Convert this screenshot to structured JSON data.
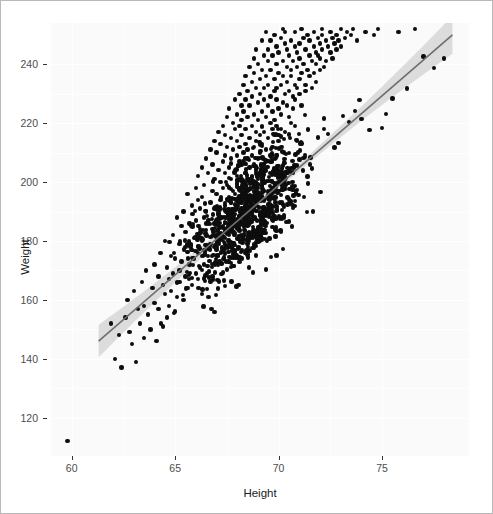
{
  "chart_data": {
    "type": "scatter",
    "title": "",
    "subtitle": "",
    "xlabel": "Height",
    "ylabel": "Weight",
    "xlim": [
      59.0,
      79.2
    ],
    "ylim": [
      107,
      254
    ],
    "xticks": [
      60,
      65,
      70,
      75
    ],
    "yticks": [
      120,
      140,
      160,
      180,
      200,
      220,
      240
    ],
    "xtick_labels": [
      "60",
      "65",
      "70",
      "75"
    ],
    "ytick_labels": [
      "120",
      "140",
      "160",
      "180",
      "200",
      "220",
      "240"
    ],
    "grid": true,
    "legend": null,
    "point_color": "#0d0d0d",
    "point_size": 4.4,
    "panel_background": "#fafafa",
    "grid_color": "#ffffff",
    "annotations": [],
    "trend": {
      "type": "linear-regression",
      "line_color": "#6e6e6e",
      "band_color": "#d5d5d5",
      "x_start": 61.3,
      "x_end": 78.4,
      "y_start": 146.0,
      "y_end": 250.0,
      "slope": 6.08,
      "intercept": -226.7,
      "band_halfwidth_start": 5.5,
      "band_halfwidth_mid": 1.2,
      "band_halfwidth_end": 6.5
    },
    "n_points": 1000,
    "x": [
      59.8,
      61.9,
      62.1,
      62.3,
      62.4,
      62.6,
      62.7,
      62.8,
      62.9,
      63.0,
      63.1,
      63.2,
      63.3,
      63.4,
      63.5,
      63.5,
      63.6,
      63.7,
      63.8,
      63.9,
      64.0,
      64.0,
      64.1,
      64.2,
      64.2,
      64.3,
      64.4,
      64.4,
      64.5,
      64.5,
      64.6,
      64.6,
      64.7,
      64.7,
      64.8,
      64.8,
      64.9,
      64.9,
      65.0,
      65.0,
      65.1,
      65.1,
      65.2,
      65.2,
      65.2,
      65.3,
      65.3,
      65.4,
      65.4,
      65.5,
      65.5,
      65.5,
      65.6,
      65.6,
      65.7,
      65.7,
      65.8,
      65.8,
      65.8,
      65.9,
      65.9,
      66.0,
      66.0,
      66.0,
      66.1,
      66.1,
      66.1,
      66.2,
      66.2,
      66.2,
      66.3,
      66.3,
      66.3,
      66.4,
      66.4,
      66.4,
      66.5,
      66.5,
      66.5,
      66.6,
      66.6,
      66.6,
      66.7,
      66.7,
      66.7,
      66.8,
      66.8,
      66.8,
      66.9,
      66.9,
      66.9,
      67.0,
      67.0,
      67.0,
      67.0,
      67.1,
      67.1,
      67.1,
      67.2,
      67.2,
      67.2,
      67.2,
      67.3,
      67.3,
      67.3,
      67.3,
      67.4,
      67.4,
      67.4,
      67.4,
      67.5,
      67.5,
      67.5,
      67.5,
      67.6,
      67.6,
      67.6,
      67.6,
      67.7,
      67.7,
      67.7,
      67.7,
      67.8,
      67.8,
      67.8,
      67.8,
      67.9,
      67.9,
      67.9,
      67.9,
      68.0,
      68.0,
      68.0,
      68.0,
      68.0,
      68.1,
      68.1,
      68.1,
      68.1,
      68.1,
      68.2,
      68.2,
      68.2,
      68.2,
      68.2,
      68.3,
      68.3,
      68.3,
      68.3,
      68.3,
      68.4,
      68.4,
      68.4,
      68.4,
      68.4,
      68.5,
      68.5,
      68.5,
      68.5,
      68.5,
      68.6,
      68.6,
      68.6,
      68.6,
      68.6,
      68.7,
      68.7,
      68.7,
      68.7,
      68.7,
      68.8,
      68.8,
      68.8,
      68.8,
      68.8,
      68.9,
      68.9,
      68.9,
      68.9,
      68.9,
      69.0,
      69.0,
      69.0,
      69.0,
      69.0,
      69.1,
      69.1,
      69.1,
      69.1,
      69.1,
      69.2,
      69.2,
      69.2,
      69.2,
      69.2,
      69.3,
      69.3,
      69.3,
      69.3,
      69.3,
      69.4,
      69.4,
      69.4,
      69.4,
      69.4,
      69.5,
      69.5,
      69.5,
      69.5,
      69.5,
      69.6,
      69.6,
      69.6,
      69.6,
      69.6,
      69.7,
      69.7,
      69.7,
      69.7,
      69.7,
      69.8,
      69.8,
      69.8,
      69.8,
      69.8,
      69.9,
      69.9,
      69.9,
      69.9,
      69.9,
      70.0,
      70.0,
      70.0,
      70.0,
      70.0,
      70.1,
      70.1,
      70.1,
      70.1,
      70.2,
      70.2,
      70.2,
      70.2,
      70.3,
      70.3,
      70.3,
      70.3,
      70.4,
      70.4,
      70.4,
      70.4,
      70.5,
      70.5,
      70.5,
      70.5,
      70.6,
      70.6,
      70.6,
      70.6,
      70.7,
      70.7,
      70.7,
      70.7,
      70.8,
      70.8,
      70.8,
      70.8,
      70.9,
      70.9,
      70.9,
      70.9,
      71.0,
      71.0,
      71.0,
      71.0,
      71.1,
      71.1,
      71.1,
      71.2,
      71.2,
      71.2,
      71.3,
      71.3,
      71.3,
      71.4,
      71.4,
      71.4,
      71.5,
      71.5,
      71.5,
      71.6,
      71.6,
      71.6,
      71.7,
      71.7,
      71.7,
      71.8,
      71.8,
      71.8,
      71.9,
      71.9,
      71.9,
      72.0,
      72.0,
      72.0,
      72.1,
      72.1,
      72.1,
      72.2,
      72.2,
      72.3,
      72.3,
      72.4,
      72.4,
      72.5,
      72.5,
      72.6,
      72.6,
      72.7,
      72.7,
      72.8,
      72.8,
      72.9,
      72.9,
      73.0,
      73.0,
      73.1,
      73.2,
      73.3,
      73.4,
      73.5,
      73.6,
      73.7,
      73.8,
      73.9,
      74.0,
      74.2,
      74.4,
      74.6,
      74.8,
      75.0,
      75.2,
      75.5,
      75.8,
      76.2,
      76.6,
      77.0,
      77.5,
      78.0
    ],
    "y": [
      112,
      152,
      140,
      148,
      137,
      154,
      160,
      149,
      145,
      163,
      139,
      157,
      152,
      166,
      147,
      158,
      170,
      155,
      150,
      164,
      159,
      172,
      146,
      168,
      157,
      176,
      151,
      165,
      162,
      180,
      154,
      171,
      167,
      158,
      175,
      163,
      169,
      182,
      156,
      174,
      161,
      188,
      170,
      179,
      166,
      185,
      173,
      160,
      190,
      168,
      178,
      183,
      164,
      196,
      172,
      186,
      177,
      192,
      165,
      181,
      174,
      198,
      187,
      169,
      194,
      176,
      202,
      184,
      171,
      191,
      180,
      205,
      195,
      177,
      188,
      199,
      182,
      208,
      190,
      175,
      203,
      186,
      211,
      193,
      179,
      197,
      206,
      184,
      214,
      191,
      201,
      187,
      210,
      196,
      178,
      217,
      204,
      189,
      200,
      213,
      194,
      182,
      207,
      219,
      198,
      185,
      209,
      192,
      216,
      203,
      190,
      222,
      199,
      212,
      195,
      205,
      186,
      225,
      201,
      215,
      193,
      208,
      220,
      197,
      211,
      188,
      228,
      204,
      218,
      196,
      209,
      223,
      191,
      214,
      202,
      230,
      207,
      219,
      198,
      212,
      226,
      194,
      221,
      206,
      216,
      233,
      200,
      210,
      224,
      190,
      228,
      213,
      203,
      236,
      218,
      208,
      231,
      197,
      222,
      211,
      239,
      205,
      226,
      215,
      201,
      234,
      219,
      209,
      229,
      195,
      242,
      212,
      223,
      206,
      237,
      217,
      204,
      232,
      214,
      245,
      221,
      208,
      227,
      199,
      240,
      216,
      230,
      210,
      235,
      202,
      248,
      224,
      213,
      238,
      219,
      206,
      243,
      228,
      217,
      232,
      211,
      251,
      222,
      236,
      207,
      241,
      226,
      215,
      245,
      233,
      220,
      209,
      248,
      229,
      238,
      218,
      253,
      224,
      212,
      243,
      231,
      250,
      221,
      235,
      216,
      246,
      228,
      240,
      219,
      232,
      254,
      225,
      244,
      214,
      237,
      249,
      223,
      233,
      218,
      252,
      241,
      227,
      236,
      247,
      230,
      217,
      251,
      239,
      226,
      245,
      234,
      222,
      254,
      243,
      231,
      238,
      220,
      248,
      236,
      229,
      253,
      241,
      225,
      246,
      233,
      251,
      228,
      239,
      244,
      232,
      255,
      235,
      247,
      230,
      242,
      252,
      237,
      226,
      249,
      240,
      255,
      233,
      245,
      231,
      250,
      238,
      254,
      243,
      236,
      248,
      241,
      232,
      253,
      246,
      237,
      251,
      244,
      240,
      234,
      249,
      243,
      255,
      238,
      247,
      242,
      252,
      245,
      250,
      239,
      254,
      248,
      241,
      253,
      246,
      244,
      251,
      249,
      242,
      255,
      247,
      245,
      250,
      253,
      248,
      252,
      246,
      254,
      249,
      251,
      253,
      250,
      252,
      254,
      248,
      253,
      255,
      251,
      254,
      250,
      252,
      255,
      253,
      254,
      251,
      255,
      252,
      254,
      253,
      255,
      254,
      253,
      255,
      252,
      254,
      255,
      253,
      254,
      255,
      254,
      255,
      253,
      254,
      255,
      228
    ]
  },
  "axes": {
    "x_title": "Height",
    "y_title": "Weight"
  }
}
